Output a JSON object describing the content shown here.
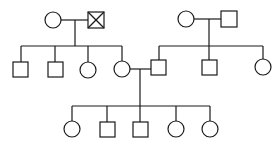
{
  "diagram": {
    "type": "pedigree",
    "colors": {
      "line": "#1a1a1a",
      "background": "#ffffff"
    },
    "generations": [
      {
        "id": "I",
        "individuals": [
          {
            "id": "I-1",
            "sex": "female",
            "shape": "circle",
            "affected": false,
            "cx": 53,
            "cy": 20
          },
          {
            "id": "I-2",
            "sex": "male",
            "shape": "square",
            "status": "deceased-crossed",
            "cx": 96,
            "cy": 20
          },
          {
            "id": "I-3",
            "sex": "female",
            "shape": "circle",
            "affected": false,
            "cx": 186,
            "cy": 19
          },
          {
            "id": "I-4",
            "sex": "male",
            "shape": "square",
            "affected": false,
            "cx": 229,
            "cy": 19
          }
        ]
      },
      {
        "id": "II",
        "individuals": [
          {
            "id": "II-1",
            "sex": "male",
            "shape": "square",
            "cx": 21,
            "cy": 70
          },
          {
            "id": "II-2",
            "sex": "male",
            "shape": "square",
            "cx": 55,
            "cy": 70
          },
          {
            "id": "II-3",
            "sex": "female",
            "shape": "circle",
            "cx": 88,
            "cy": 70
          },
          {
            "id": "II-4",
            "sex": "female",
            "shape": "circle",
            "cx": 122,
            "cy": 69
          },
          {
            "id": "II-5",
            "sex": "male",
            "shape": "square",
            "cx": 159,
            "cy": 68
          },
          {
            "id": "II-6",
            "sex": "male",
            "shape": "square",
            "cx": 209,
            "cy": 68
          },
          {
            "id": "II-7",
            "sex": "female",
            "shape": "circle",
            "cx": 263,
            "cy": 67
          }
        ]
      },
      {
        "id": "III",
        "individuals": [
          {
            "id": "III-1",
            "sex": "female",
            "shape": "circle",
            "cx": 72,
            "cy": 129
          },
          {
            "id": "III-2",
            "sex": "male",
            "shape": "square",
            "cx": 107,
            "cy": 129
          },
          {
            "id": "III-3",
            "sex": "male",
            "shape": "square",
            "cx": 140,
            "cy": 129
          },
          {
            "id": "III-4",
            "sex": "female",
            "shape": "circle",
            "cx": 176,
            "cy": 129
          },
          {
            "id": "III-5",
            "sex": "female",
            "shape": "circle",
            "cx": 210,
            "cy": 129
          }
        ]
      }
    ],
    "matings": [
      {
        "partners": [
          "I-1",
          "I-2"
        ],
        "children": [
          "II-1",
          "II-2",
          "II-3",
          "II-4"
        ]
      },
      {
        "partners": [
          "I-3",
          "I-4"
        ],
        "children": [
          "II-5",
          "II-6",
          "II-7"
        ]
      },
      {
        "partners": [
          "II-4",
          "II-5"
        ],
        "children": [
          "III-1",
          "III-2",
          "III-3",
          "III-4",
          "III-5"
        ]
      }
    ],
    "legend": []
  }
}
